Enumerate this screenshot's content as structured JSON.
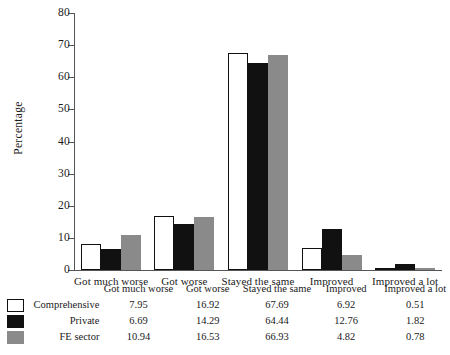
{
  "chart_data": {
    "type": "bar",
    "title": "",
    "xlabel": "",
    "ylabel": "Percentage",
    "ylim": [
      0,
      80
    ],
    "yticks": [
      0,
      10,
      20,
      30,
      40,
      50,
      60,
      70,
      80
    ],
    "grid": false,
    "legend_position": "bottom-table",
    "categories": [
      "Got much worse",
      "Got worse",
      "Stayed the same",
      "Improved",
      "Improved a lot"
    ],
    "series": [
      {
        "name": "Comprehensive",
        "color": "#ffffff",
        "values": [
          7.95,
          16.92,
          67.69,
          6.92,
          0.51
        ],
        "labels": [
          "7.95",
          "16.92",
          "67.69",
          "6.92",
          "0.51"
        ]
      },
      {
        "name": "Private",
        "color": "#111111",
        "values": [
          6.69,
          14.29,
          64.44,
          12.76,
          1.82
        ],
        "labels": [
          "6.69",
          "14.29",
          "64.44",
          "12.76",
          "1.82"
        ]
      },
      {
        "name": "FE sector",
        "color": "#8a8a8a",
        "values": [
          10.94,
          16.53,
          66.93,
          4.82,
          0.78
        ],
        "labels": [
          "10.94",
          "16.53",
          "66.93",
          "4.82",
          "0.78"
        ]
      }
    ]
  },
  "axis": {
    "y_title": "Percentage",
    "y_tick_labels": [
      "0",
      "10",
      "20",
      "30",
      "40",
      "50",
      "60",
      "70",
      "80"
    ]
  },
  "colors": {
    "series_comprehensive": "#ffffff",
    "series_private": "#111111",
    "series_fe_sector": "#8a8a8a",
    "axis": "#555555",
    "text": "#1a1a1a"
  }
}
